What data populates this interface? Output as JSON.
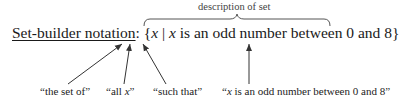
{
  "brace_label": "description of set",
  "main": {
    "label": "Set-builder notation",
    "colon": ":",
    "open_brace": "{",
    "var1": "x",
    "bar": "|",
    "var2": "x",
    "description": "is an odd number between 0 and 8",
    "close_brace": "}"
  },
  "annotations": [
    {
      "text": "“the set of”"
    },
    {
      "pre": "“all ",
      "var": "x",
      "post": "”"
    },
    {
      "text": "“such that”"
    },
    {
      "pre": "“",
      "var": "x",
      "post": " is an odd number between 0 and 8”"
    }
  ],
  "colors": {
    "text": "#1a1a1a",
    "lines": "#333333",
    "label": "#444444"
  }
}
